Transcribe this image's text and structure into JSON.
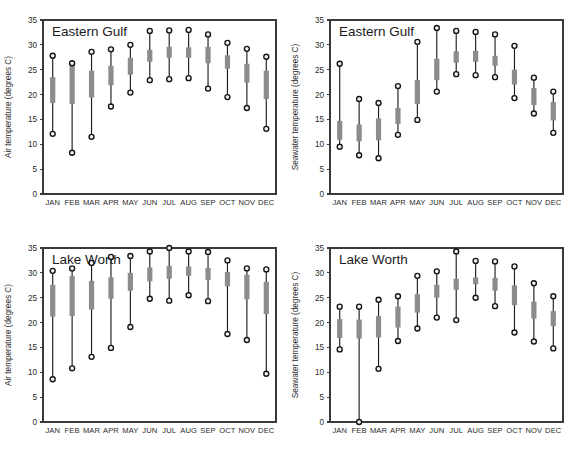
{
  "figure": {
    "background_color": "#ffffff",
    "line_color": "#1d1d1d",
    "bar_color": "#8c8c8c",
    "marker_fill": "#f2f2f2",
    "marker_stroke": "#141414",
    "axis_color": "#3a3a3a"
  },
  "top_artifact": "",
  "chart_data": [
    {
      "type": "bar",
      "panel_id": "eastern-gulf-air",
      "title": "Eastern Gulf",
      "xlabel": "",
      "ylabel": "Air temperature (degrees C)",
      "ylim": [
        0,
        35
      ],
      "yticks": [
        0,
        5,
        10,
        15,
        20,
        25,
        30,
        35
      ],
      "grid": false,
      "legend": "none",
      "categories": [
        "JAN",
        "FEB",
        "MAR",
        "APR",
        "MAY",
        "JUN",
        "JUL",
        "AUG",
        "SEP",
        "OCT",
        "NOV",
        "DEC"
      ],
      "series": [
        {
          "name": "maximum",
          "values": [
            27.8,
            26.3,
            28.6,
            29.1,
            30.0,
            32.8,
            32.9,
            33.0,
            32.1,
            30.4,
            29.2,
            27.6
          ]
        },
        {
          "name": "minimum",
          "values": [
            12.1,
            8.3,
            11.5,
            17.6,
            20.4,
            22.9,
            23.1,
            23.3,
            21.2,
            19.5,
            17.3,
            13.1
          ]
        },
        {
          "name": "box_top",
          "values": [
            23.5,
            26.0,
            24.8,
            25.8,
            27.4,
            29.0,
            29.6,
            29.5,
            29.6,
            27.9,
            26.2,
            24.8
          ]
        },
        {
          "name": "box_bottom",
          "values": [
            18.3,
            18.1,
            19.4,
            21.9,
            24.0,
            26.6,
            27.4,
            27.4,
            26.3,
            25.2,
            22.4,
            19.1
          ]
        }
      ]
    },
    {
      "type": "bar",
      "panel_id": "eastern-gulf-seawater",
      "title": "Eastern Gulf",
      "xlabel": "",
      "ylabel": "Seawater temperature (degrees C)",
      "ylim": [
        0,
        35
      ],
      "yticks": [
        0,
        5,
        10,
        15,
        20,
        25,
        30,
        35
      ],
      "grid": false,
      "legend": "none",
      "categories": [
        "JAN",
        "FEB",
        "MAR",
        "APR",
        "MAY",
        "JUN",
        "JUL",
        "AUG",
        "SEP",
        "OCT",
        "NOV",
        "DEC"
      ],
      "series": [
        {
          "name": "maximum",
          "values": [
            26.2,
            19.1,
            18.3,
            21.7,
            30.6,
            33.4,
            32.8,
            32.6,
            32.1,
            29.8,
            23.4,
            20.6
          ]
        },
        {
          "name": "minimum",
          "values": [
            9.5,
            7.8,
            7.2,
            11.9,
            14.9,
            20.6,
            24.1,
            23.9,
            23.5,
            19.3,
            16.2,
            12.3
          ]
        },
        {
          "name": "box_top",
          "values": [
            14.7,
            14.0,
            15.2,
            17.3,
            22.9,
            27.2,
            28.7,
            28.8,
            27.8,
            25.0,
            21.3,
            18.5
          ]
        },
        {
          "name": "box_bottom",
          "values": [
            10.9,
            10.6,
            10.8,
            14.1,
            18.1,
            22.9,
            26.4,
            26.6,
            25.8,
            22.0,
            17.9,
            14.8
          ]
        }
      ]
    },
    {
      "type": "bar",
      "panel_id": "lake-worth-air",
      "title": "Lake Worth",
      "xlabel": "",
      "ylabel": "Air temperature (degrees C)",
      "ylim": [
        0,
        35
      ],
      "yticks": [
        0,
        5,
        10,
        15,
        20,
        25,
        30,
        35
      ],
      "grid": false,
      "legend": "none",
      "categories": [
        "JAN",
        "FEB",
        "MAR",
        "APR",
        "MAY",
        "JUN",
        "JUL",
        "AUG",
        "SEP",
        "OCT",
        "NOV",
        "DEC"
      ],
      "series": [
        {
          "name": "maximum",
          "values": [
            30.4,
            30.9,
            32.0,
            33.2,
            33.4,
            34.3,
            35.0,
            34.3,
            34.2,
            32.5,
            30.9,
            30.7
          ]
        },
        {
          "name": "minimum",
          "values": [
            8.6,
            10.8,
            13.1,
            14.9,
            19.1,
            24.8,
            24.4,
            25.5,
            24.3,
            17.7,
            16.5,
            9.7
          ]
        },
        {
          "name": "box_top",
          "values": [
            27.6,
            29.4,
            28.4,
            29.1,
            30.0,
            31.1,
            31.4,
            31.3,
            31.0,
            30.2,
            29.6,
            28.2
          ]
        },
        {
          "name": "box_bottom",
          "values": [
            21.2,
            21.3,
            22.6,
            24.8,
            26.4,
            28.3,
            28.8,
            29.4,
            28.6,
            27.3,
            24.7,
            21.7
          ]
        }
      ]
    },
    {
      "type": "bar",
      "panel_id": "lake-worth-seawater",
      "title": "Lake Worth",
      "xlabel": "",
      "ylabel": "Seawater temperature (degrees C)",
      "ylim": [
        0,
        35
      ],
      "yticks": [
        0,
        5,
        10,
        15,
        20,
        25,
        30,
        35
      ],
      "grid": false,
      "legend": "none",
      "categories": [
        "JAN",
        "FEB",
        "MAR",
        "APR",
        "MAY",
        "JUN",
        "JUL",
        "AUG",
        "SEP",
        "OCT",
        "NOV",
        "DEC"
      ],
      "series": [
        {
          "name": "maximum",
          "values": [
            23.2,
            23.2,
            24.6,
            25.3,
            29.4,
            30.3,
            34.3,
            32.4,
            32.3,
            31.3,
            27.9,
            25.3
          ]
        },
        {
          "name": "minimum",
          "values": [
            14.6,
            0.0,
            10.7,
            16.3,
            18.8,
            21.0,
            20.5,
            25.0,
            23.3,
            18.0,
            16.2,
            14.8
          ]
        },
        {
          "name": "box_top",
          "values": [
            20.7,
            20.6,
            21.3,
            23.2,
            25.7,
            27.6,
            28.8,
            29.1,
            29.0,
            27.5,
            24.2,
            22.3
          ]
        },
        {
          "name": "box_bottom",
          "values": [
            16.9,
            16.8,
            17.0,
            19.0,
            22.0,
            25.0,
            26.6,
            27.7,
            26.4,
            23.5,
            20.8,
            19.3
          ]
        }
      ]
    }
  ]
}
